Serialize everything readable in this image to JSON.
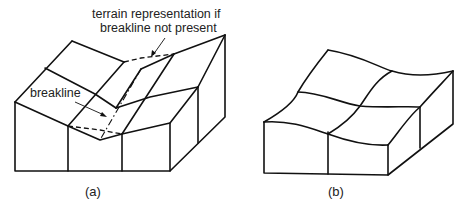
{
  "figure_a": {
    "caption": "(a)",
    "annotation_terrain_line1": "terrain representation if",
    "annotation_terrain_line2": "breakline not present",
    "annotation_breakline": "breakline"
  },
  "figure_b": {
    "caption": "(b)"
  }
}
